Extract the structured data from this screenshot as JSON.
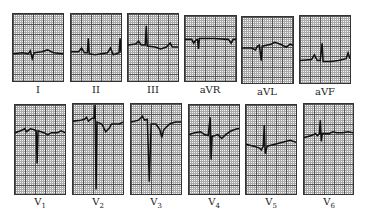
{
  "figure": {
    "rows": [
      {
        "leads": [
          {
            "id": "I",
            "label": "I"
          },
          {
            "id": "II",
            "label": "II"
          },
          {
            "id": "III",
            "label": "III"
          },
          {
            "id": "aVR",
            "label": "aVR"
          },
          {
            "id": "aVL",
            "label": "aVL"
          },
          {
            "id": "aVF",
            "label": "aVF"
          }
        ]
      },
      {
        "leads": [
          {
            "id": "V1",
            "label": "V",
            "sub": "1"
          },
          {
            "id": "V2",
            "label": "V",
            "sub": "2"
          },
          {
            "id": "V3",
            "label": "V",
            "sub": "3"
          },
          {
            "id": "V4",
            "label": "V",
            "sub": "4"
          },
          {
            "id": "V5",
            "label": "V",
            "sub": "5"
          },
          {
            "id": "V6",
            "label": "V",
            "sub": "6"
          }
        ]
      }
    ]
  },
  "colors": {
    "trace": "#111111",
    "grid_major": "#555555",
    "grid_minor": "#aaaaaa",
    "paper": "#f4f4f4"
  }
}
